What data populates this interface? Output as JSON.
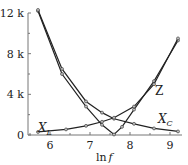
{
  "chart_data": {
    "type": "line",
    "title": "",
    "xlabel": "ln f",
    "ylabel": "",
    "xlim": [
      5.55,
      9.35
    ],
    "ylim": [
      0,
      12500
    ],
    "x_ticks": [
      6,
      7,
      8,
      9
    ],
    "x_tick_labels": [
      "6",
      "7",
      "8",
      "9"
    ],
    "y_ticks": [
      0,
      4000,
      8000,
      12000
    ],
    "y_tick_labels": [
      "0",
      "4 k",
      "8 k",
      "12 k"
    ],
    "grid": false,
    "legend": "inline labels",
    "series": [
      {
        "name": "Z",
        "x": [
          5.7,
          6.3,
          6.9,
          7.3,
          7.6,
          7.8,
          8.1,
          8.6,
          9.2
        ],
        "values": [
          12200,
          6000,
          2800,
          1000,
          50,
          800,
          2500,
          5300,
          9300
        ]
      },
      {
        "name": "X_C",
        "x": [
          5.7,
          6.3,
          6.9,
          7.3,
          7.6,
          8.1,
          8.6,
          9.2
        ],
        "values": [
          12300,
          6500,
          3300,
          2200,
          1600,
          1100,
          650,
          350
        ]
      },
      {
        "name": "X_L",
        "x": [
          5.7,
          6.4,
          6.9,
          7.3,
          7.6,
          8.1,
          8.6,
          9.2
        ],
        "values": [
          300,
          550,
          900,
          1300,
          1700,
          2800,
          5000,
          9500
        ]
      }
    ],
    "annotations": [
      "X_L",
      "X_C",
      "Z"
    ]
  },
  "labels": {
    "xlabel_main": "ln",
    "xlabel_var": "f",
    "z": "Z",
    "xl_main": "X",
    "xl_sub": "L",
    "xc_main": "X",
    "xc_sub": "C"
  }
}
